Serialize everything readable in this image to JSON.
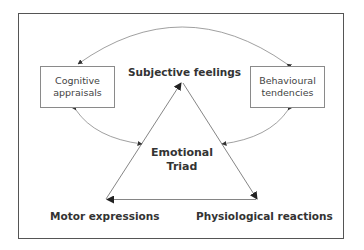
{
  "diagram": {
    "nodes": {
      "subjective_feelings": "Subjective feelings",
      "motor_expressions": "Motor expressions",
      "physiological_reactions": "Physiological reactions",
      "cognitive_appraisals": {
        "line1": "Cognitive",
        "line2": "appraisals"
      },
      "behavioural_tendencies": {
        "line1": "Behavioural",
        "line2": "tendencies"
      },
      "center": {
        "line1": "Emotional",
        "line2": "Triad"
      }
    },
    "edges": [
      {
        "from": "Motor expressions",
        "to": "Subjective feelings",
        "type": "triangle-side"
      },
      {
        "from": "Subjective feelings",
        "to": "Physiological reactions",
        "type": "triangle-side"
      },
      {
        "from": "Physiological reactions",
        "to": "Motor expressions",
        "type": "triangle-side"
      },
      {
        "from": "Behavioural tendencies",
        "to": "Cognitive appraisals",
        "type": "bidirectional-curve"
      },
      {
        "from": "Cognitive appraisals",
        "to": "Emotional Triad",
        "type": "bidirectional-curve"
      },
      {
        "from": "Behavioural tendencies",
        "to": "Emotional Triad",
        "type": "bidirectional-curve"
      }
    ],
    "colors": {
      "frame": "#555555",
      "lines": "#777777",
      "text": "#333333"
    }
  }
}
